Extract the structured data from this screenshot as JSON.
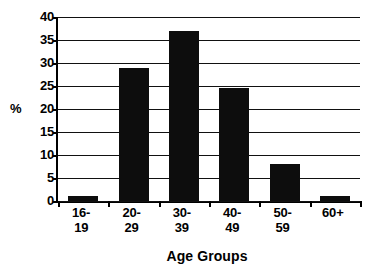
{
  "chart_data": {
    "type": "bar",
    "title": "",
    "subtitle": "",
    "xlabel": "Age Groups",
    "ylabel": "%",
    "categories": [
      "16-19",
      "20-29",
      "30-39",
      "40-49",
      "50-59",
      "60+"
    ],
    "category_lines": [
      [
        "16-",
        "19"
      ],
      [
        "20-",
        "29"
      ],
      [
        "30-",
        "39"
      ],
      [
        "40-",
        "49"
      ],
      [
        "50-",
        "59"
      ],
      [
        "60+",
        ""
      ]
    ],
    "values": [
      1,
      29,
      37,
      24.5,
      8,
      1
    ],
    "ylim": [
      0,
      40
    ],
    "ytick_step": 5,
    "yticks": [
      40,
      35,
      30,
      25,
      20,
      15,
      10,
      5,
      0
    ],
    "ytick_labels": [
      "40",
      "35",
      "30",
      "25",
      "20",
      "15",
      "10",
      "5",
      "0"
    ],
    "grid": true,
    "grid_axis": "y",
    "legend": false,
    "legend_position": "none",
    "bar_color": "#0d0d0d",
    "axis_color": "#000000",
    "grid_color": "#111111",
    "background_color": "#ffffff"
  }
}
